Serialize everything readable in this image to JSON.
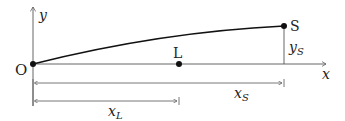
{
  "diagram": {
    "points": {
      "origin": {
        "label": "O"
      },
      "L": {
        "label": "L"
      },
      "S": {
        "label": "S"
      }
    },
    "axes": {
      "x_label": "x",
      "y_label": "y"
    },
    "dimensions": {
      "xS": {
        "base": "x",
        "sub": "S"
      },
      "xL": {
        "base": "x",
        "sub": "L"
      },
      "yS": {
        "base": "y",
        "sub": "S"
      }
    },
    "colors": {
      "line": "#111111",
      "axis": "#555555"
    }
  }
}
